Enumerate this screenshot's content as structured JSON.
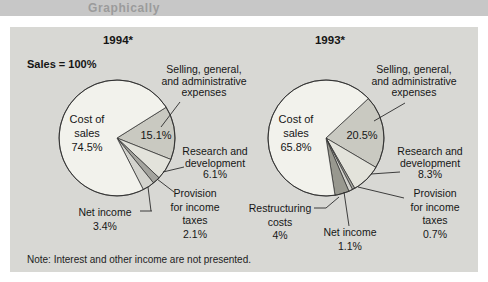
{
  "page": {
    "band_label": "Graphically",
    "sales_label": "Sales = 100%",
    "note": "Note: Interest and other income are not presented.",
    "colors": {
      "band_bg": "#c7c7c7",
      "band_text": "#9b9b9b",
      "panel_bg": "#d8d8d4",
      "outline": "#2b2b2b"
    }
  },
  "chart_data": [
    {
      "type": "pie",
      "title": "1994*",
      "start_angle_deg": 58,
      "center": {
        "x": 117,
        "y": 138,
        "r": 58
      },
      "slices": [
        {
          "name": "Selling, general, and administrative expenses",
          "value": 15.1,
          "color": "#c9c9c1",
          "pct_label": "15.1%",
          "label_lines": [
            "Selling, general,",
            "and administrative",
            "expenses"
          ]
        },
        {
          "name": "Research and development",
          "value": 6.1,
          "color": "#e3e3db",
          "label_lines": [
            "Research and",
            "development",
            "6.1%"
          ]
        },
        {
          "name": "Provision for income taxes",
          "value": 2.1,
          "color": "#a4a49e",
          "label_lines": [
            "Provision",
            "for income",
            "taxes",
            "2.1%"
          ]
        },
        {
          "name": "Net income",
          "value": 3.4,
          "color": "#d3d3cd",
          "label_lines": [
            "Net income",
            "3.4%"
          ]
        },
        {
          "name": "Cost of sales",
          "value": 74.5,
          "color": "#f2f2ec",
          "label_lines": [
            "Cost of",
            "sales",
            "74.5%"
          ]
        }
      ]
    },
    {
      "type": "pie",
      "title": "1993*",
      "start_angle_deg": 47,
      "center": {
        "x": 326,
        "y": 138,
        "r": 58
      },
      "slices": [
        {
          "name": "Selling, general, and administrative expenses",
          "value": 20.5,
          "color": "#c9c9c1",
          "pct_label": "20.5%",
          "label_lines": [
            "Selling, general,",
            "and administrative",
            "expenses"
          ]
        },
        {
          "name": "Research and development",
          "value": 8.3,
          "color": "#e3e3db",
          "label_lines": [
            "Research and",
            "development",
            "8.3%"
          ]
        },
        {
          "name": "Provision for income taxes",
          "value": 0.7,
          "color": "#a4a49e",
          "label_lines": [
            "Provision",
            "for income",
            "taxes",
            "0.7%"
          ]
        },
        {
          "name": "Net income",
          "value": 1.1,
          "color": "#d3d3cd",
          "label_lines": [
            "Net income",
            "1.1%"
          ]
        },
        {
          "name": "Restructuring costs",
          "value": 4,
          "color": "#98988f",
          "label_lines": [
            "Restructuring",
            "costs",
            "4%"
          ]
        },
        {
          "name": "Cost of sales",
          "value": 65.8,
          "color": "#f2f2ec",
          "label_lines": [
            "Cost of",
            "sales",
            "65.8%"
          ]
        }
      ]
    }
  ]
}
